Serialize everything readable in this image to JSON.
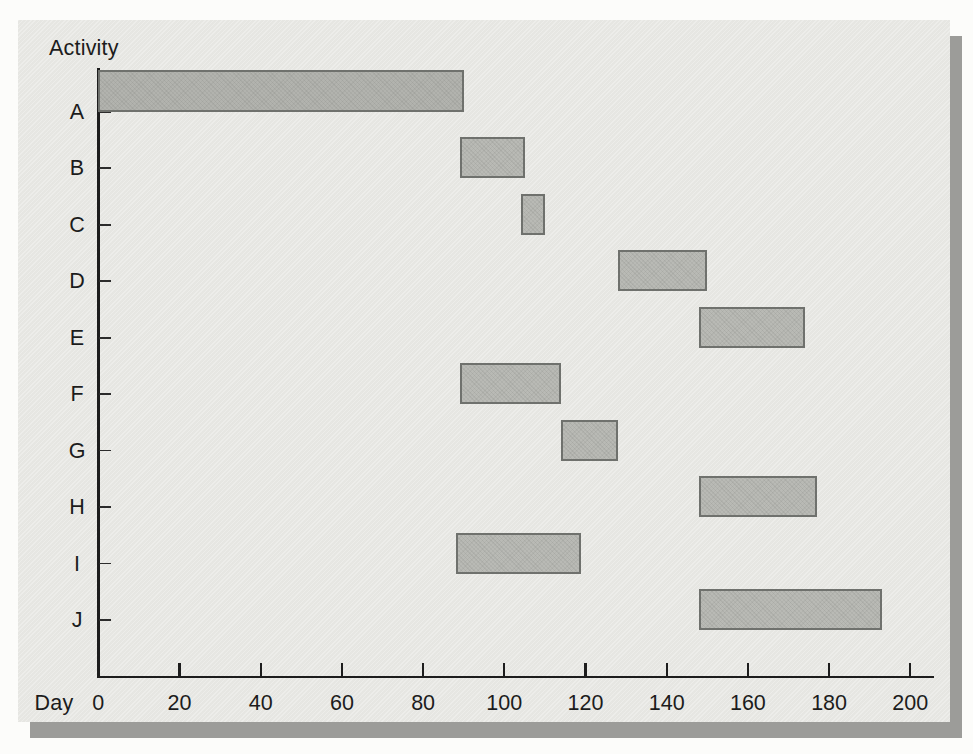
{
  "chart_data": {
    "type": "bar",
    "subtype": "gantt",
    "title": "",
    "xlabel": "Day",
    "ylabel": "Activity",
    "xlim": [
      0,
      200
    ],
    "x_ticks": [
      0,
      20,
      40,
      60,
      80,
      100,
      120,
      140,
      160,
      180,
      200
    ],
    "grid": "off",
    "categories": [
      "A",
      "B",
      "C",
      "D",
      "E",
      "F",
      "G",
      "H",
      "I",
      "J"
    ],
    "activities": [
      {
        "label": "A",
        "start_day": 0,
        "end_day": 90
      },
      {
        "label": "B",
        "start_day": 89,
        "end_day": 105
      },
      {
        "label": "C",
        "start_day": 104,
        "end_day": 110
      },
      {
        "label": "D",
        "start_day": 128,
        "end_day": 150
      },
      {
        "label": "E",
        "start_day": 148,
        "end_day": 174
      },
      {
        "label": "F",
        "start_day": 89,
        "end_day": 114
      },
      {
        "label": "G",
        "start_day": 114,
        "end_day": 128
      },
      {
        "label": "H",
        "start_day": 148,
        "end_day": 177
      },
      {
        "label": "I",
        "start_day": 88,
        "end_day": 119
      },
      {
        "label": "J",
        "start_day": 148,
        "end_day": 193
      }
    ],
    "colors": {
      "page_background": "#fcfcfa",
      "panel_background": "#e9e9e5",
      "panel_shadow": "#9c9c99",
      "bar_fill": "#b9bab5",
      "bar_border": "#6f716d",
      "axis": "#1d1d1d",
      "text": "#1c1c1c"
    }
  }
}
